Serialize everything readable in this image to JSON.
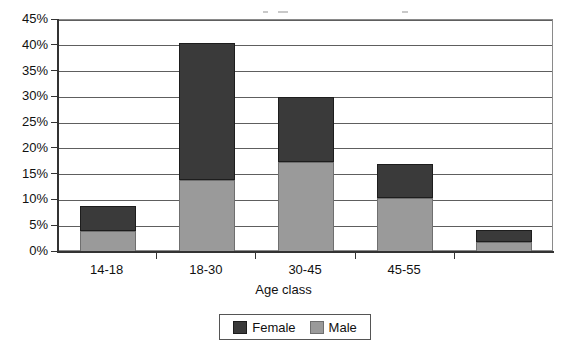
{
  "chart_data": {
    "type": "bar",
    "subtype": "stacked-bar",
    "title": "",
    "xlabel": "Age class",
    "ylabel": "",
    "categories": [
      "14-18",
      "18-30",
      "30-45",
      "45-55",
      ""
    ],
    "series": [
      {
        "name": "Male",
        "color": "#9a9a9a",
        "values": [
          4.0,
          14.0,
          17.5,
          10.5,
          2.0
        ]
      },
      {
        "name": "Female",
        "color": "#3a3a3a",
        "values": [
          5.0,
          26.5,
          12.5,
          6.5,
          2.3
        ]
      }
    ],
    "stack_totals": [
      9.0,
      40.5,
      30.0,
      17.0,
      4.3
    ],
    "ylim": [
      0,
      45
    ],
    "ytick_step": 5,
    "ytick_labels": [
      "0%",
      "5%",
      "10%",
      "15%",
      "20%",
      "25%",
      "30%",
      "35%",
      "40%",
      "45%"
    ],
    "ytick_values": [
      0,
      5,
      10,
      15,
      20,
      25,
      30,
      35,
      40,
      45
    ],
    "grid": true,
    "grid_axis": "y",
    "legend_position": "bottom",
    "units": "percent"
  },
  "axes": {
    "y_labels": [
      "45%",
      "40%",
      "35%",
      "30%",
      "25%",
      "20%",
      "15%",
      "10%",
      "5%",
      "0%"
    ],
    "x_labels": [
      "14-18",
      "18-30",
      "30-45",
      "45-55",
      ""
    ],
    "x_title": "Age class"
  },
  "legend": {
    "items": [
      {
        "label": "Female",
        "color": "#3a3a3a"
      },
      {
        "label": "Male",
        "color": "#9a9a9a"
      }
    ]
  },
  "colors": {
    "female": "#3a3a3a",
    "male": "#9a9a9a",
    "grid": "#5e5e5e",
    "axis": "#333333",
    "frame": "#8a8a8a",
    "background": "#ffffff",
    "text": "#111111"
  }
}
